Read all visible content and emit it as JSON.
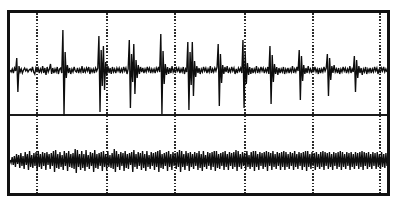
{
  "figure": {
    "title": "",
    "background_color": "#ffffff",
    "border_color": "#111111",
    "trace_color": "#0d0d0d",
    "gridline_color": "#2b2b2b",
    "divider_color": "#1a1a1a"
  },
  "chart_data": {
    "type": "line",
    "title": "",
    "xlabel": "",
    "ylabel": "",
    "grid": true,
    "legend_position": "none",
    "axis_visible": false,
    "tick_labels_x": [],
    "tick_labels_y": [],
    "xlim": [
      0,
      383
    ],
    "ylim": [
      0,
      186
    ],
    "gridlines_x": [
      30,
      100,
      168,
      238,
      306,
      373
    ],
    "panel_divider_y": 105,
    "series": [
      {
        "name": "trace-upper",
        "panel": 0,
        "baseline_y": 60,
        "description": "spiky high-amplitude biosignal with recurring sharp transients",
        "values": [
          0,
          2,
          -1,
          3,
          -2,
          1,
          -12,
          22,
          -4,
          2,
          -1,
          3,
          0,
          -2,
          1,
          -1,
          2,
          0,
          -1,
          1,
          -3,
          2,
          4,
          -2,
          1,
          -2,
          3,
          -1,
          2,
          -4,
          3,
          -2,
          5,
          -3,
          2,
          -1,
          -6,
          4,
          -2,
          3,
          -1,
          2,
          -3,
          4,
          -1,
          -2,
          3,
          -40,
          46,
          -18,
          8,
          -5,
          3,
          -2,
          4,
          -1,
          2,
          -3,
          1,
          2,
          -2,
          3,
          -1,
          2,
          -4,
          3,
          -1,
          2,
          -2,
          1,
          -3,
          4,
          -1,
          2,
          -1,
          3,
          -2,
          1,
          -2,
          -34,
          42,
          -20,
          16,
          -24,
          20,
          -8,
          6,
          -4,
          3,
          -2,
          4,
          -3,
          2,
          -1,
          3,
          -2,
          1,
          -2,
          3,
          -1,
          2,
          -3,
          1,
          -2,
          4,
          -1,
          -30,
          38,
          -16,
          12,
          -26,
          24,
          -10,
          8,
          -5,
          4,
          -3,
          2,
          -2,
          3,
          -1,
          2,
          -3,
          1,
          -2,
          3,
          -1,
          2,
          -1,
          3,
          -2,
          1,
          -3,
          2,
          -36,
          44,
          -19,
          14,
          -6,
          5,
          -3,
          4,
          -2,
          3,
          -4,
          2,
          -1,
          3,
          -2,
          1,
          -2,
          3,
          -1,
          2,
          -3,
          4,
          -1,
          2,
          -28,
          40,
          -18,
          15,
          -28,
          26,
          -9,
          7,
          -4,
          3,
          -2,
          4,
          -1,
          2,
          -3,
          1,
          -2,
          3,
          -1,
          2,
          -4,
          3,
          -1,
          2,
          -2,
          1,
          -3,
          -26,
          36,
          -16,
          13,
          -5,
          4,
          -3,
          2,
          -4,
          3,
          -1,
          2,
          -3,
          1,
          -2,
          4,
          -1,
          3,
          -2,
          1,
          -2,
          3,
          -30,
          38,
          -17,
          14,
          -7,
          5,
          -3,
          4,
          -2,
          3,
          -1,
          2,
          -4,
          3,
          -1,
          2,
          -3,
          1,
          -2,
          3,
          -1,
          2,
          -3,
          4,
          -24,
          34,
          -15,
          12,
          -6,
          4,
          -3,
          5,
          -2,
          3,
          -1,
          2,
          -3,
          4,
          -1,
          2,
          -2,
          3,
          -1,
          2,
          -4,
          3,
          -1,
          2,
          -3,
          1,
          -20,
          30,
          -14,
          11,
          -5,
          4,
          -2,
          3,
          -4,
          2,
          -1,
          3,
          -2,
          1,
          -3,
          2,
          -1,
          4,
          -2,
          3,
          -1,
          2,
          -3,
          1,
          -2,
          -16,
          26,
          -12,
          10,
          -4,
          3,
          -5,
          2,
          -1,
          3,
          -2,
          4,
          -1,
          2,
          -3,
          1,
          -2,
          3,
          -1,
          2,
          -4,
          3,
          -1,
          2,
          -14,
          22,
          -10,
          8,
          -4,
          3,
          -2,
          5,
          -1,
          2,
          -3,
          4,
          -1,
          2,
          -2,
          3,
          -1,
          2,
          -3,
          1,
          -2,
          4,
          -1,
          3,
          -2,
          1,
          -3,
          2,
          -1,
          2
        ]
      },
      {
        "name": "trace-lower",
        "panel": 1,
        "baseline_y": 150,
        "description": "dense rhythmic oscillatory biosignal, near-constant amplitude",
        "values": [
          0,
          3,
          -3,
          5,
          -4,
          7,
          -6,
          4,
          -5,
          8,
          -7,
          6,
          -4,
          9,
          -8,
          5,
          -6,
          10,
          -9,
          7,
          -5,
          8,
          -7,
          6,
          -8,
          11,
          -9,
          7,
          -6,
          9,
          -8,
          6,
          -7,
          10,
          -8,
          5,
          -6,
          9,
          -7,
          6,
          -9,
          12,
          -10,
          8,
          -6,
          9,
          -8,
          7,
          -5,
          10,
          -9,
          6,
          -7,
          11,
          -9,
          7,
          -6,
          8,
          -7,
          9,
          -11,
          13,
          -10,
          7,
          -6,
          10,
          -9,
          8,
          -6,
          11,
          -10,
          7,
          -5,
          9,
          -8,
          6,
          -7,
          12,
          -10,
          8,
          -6,
          9,
          -7,
          6,
          -8,
          11,
          -9,
          7,
          -6,
          10,
          -9,
          7,
          -5,
          8,
          -7,
          9,
          -11,
          12,
          -9,
          7,
          -6,
          10,
          -8,
          6,
          -7,
          11,
          -9,
          8,
          -6,
          9,
          -7,
          5,
          -8,
          12,
          -10,
          7,
          -6,
          9,
          -8,
          6,
          -7,
          10,
          -9,
          8,
          -6,
          11,
          -9,
          7,
          -5,
          9,
          -8,
          6,
          -7,
          10,
          -8,
          7,
          -9,
          12,
          -10,
          8,
          -6,
          9,
          -7,
          6,
          -8,
          11,
          -9,
          7,
          -6,
          10,
          -8,
          6,
          -7,
          9,
          -8,
          7,
          -10,
          12,
          -9,
          7,
          -6,
          10,
          -9,
          6,
          -7,
          11,
          -8,
          7,
          -6,
          9,
          -8,
          6,
          -7,
          10,
          -9,
          8,
          -6,
          11,
          -9,
          7,
          -5,
          9,
          -8,
          6,
          -7,
          10,
          -8,
          7,
          -9,
          11,
          -9,
          8,
          -6,
          9,
          -7,
          6,
          -8,
          10,
          -9,
          7,
          -6,
          10,
          -8,
          6,
          -7,
          9,
          -8,
          7,
          -10,
          11,
          -9,
          7,
          -6,
          9,
          -8,
          6,
          -7,
          10,
          -9,
          7,
          -5,
          9,
          -8,
          7,
          -9,
          11,
          -9,
          7,
          -6,
          10,
          -8,
          6,
          -7,
          9,
          -8,
          7,
          -9,
          11,
          -8,
          6,
          -7,
          10,
          -9,
          7,
          -6,
          9,
          -8,
          6,
          -7,
          10,
          -8,
          7,
          -9,
          10,
          -8,
          7,
          -6,
          9,
          -8,
          6,
          -7,
          10,
          -9,
          7,
          -6,
          9,
          -8,
          6,
          -7,
          10,
          -8,
          7,
          -9,
          11,
          -9,
          7,
          -6,
          9,
          -8,
          6,
          -7,
          10,
          -8,
          7,
          -6,
          9,
          -8,
          7,
          -9,
          10,
          -8,
          6,
          -7,
          9,
          -8,
          7,
          -6,
          10,
          -8,
          6,
          -7,
          9,
          -8,
          7,
          -9,
          10,
          -8,
          7,
          -6,
          9,
          -8,
          6,
          -7,
          10,
          -8,
          7,
          -6,
          9,
          -8,
          6,
          -7,
          9,
          -8,
          7,
          -9,
          10,
          -8,
          6,
          -7,
          9,
          -8,
          7,
          -6,
          9,
          -8,
          6,
          -7,
          9,
          -8,
          7,
          -6,
          9,
          -8,
          7,
          -6,
          8,
          -7,
          6
        ]
      }
    ]
  }
}
